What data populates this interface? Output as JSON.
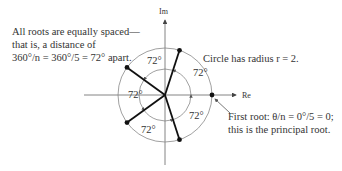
{
  "annotations": {
    "spacing": [
      "All roots are equally spaced—",
      "that is, a distance of",
      "360°/n = 360°/5 = 72° apart."
    ],
    "radius": "Circle has radius r = 2.",
    "first_root": [
      "First root:  θ/n = 0°/5 = 0;",
      "this is the principal root."
    ]
  },
  "axes": {
    "real": "Re",
    "imaginary": "Im"
  },
  "angle_label": "72°",
  "diagram": {
    "radius": 2,
    "n": 5,
    "root_angles_deg": [
      0,
      72,
      144,
      216,
      288
    ],
    "colors": {
      "spokes": "#111111",
      "circle": "#777777",
      "axes": "#555555"
    }
  }
}
